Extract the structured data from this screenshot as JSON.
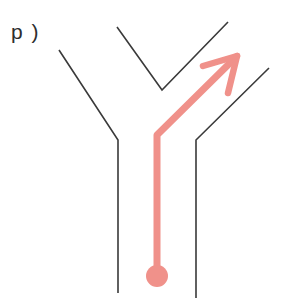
{
  "figure": {
    "panel_label": "p )",
    "width": 282,
    "height": 308,
    "background_color": "#ffffff",
    "line_color": "#3a3a3a",
    "accent_color": "#f0918a",
    "line_width": 1.6,
    "accent_width": 7
  },
  "chart_data": {
    "type": "diagram",
    "title": "",
    "annotations": [
      "p )"
    ],
    "legend": [],
    "elements": [
      {
        "name": "left-branch",
        "color": "#3a3a3a",
        "points": [
          [
            59,
            50
          ],
          [
            118,
            140
          ],
          [
            118,
            293
          ]
        ]
      },
      {
        "name": "center-v-wedge",
        "color": "#3a3a3a",
        "points": [
          [
            117,
            27
          ],
          [
            162,
            90
          ],
          [
            228,
            22
          ]
        ]
      },
      {
        "name": "right-branch",
        "color": "#3a3a3a",
        "points": [
          [
            269,
            68
          ],
          [
            196,
            140
          ],
          [
            196,
            298
          ]
        ]
      },
      {
        "name": "route-arrow",
        "color": "#f0918a",
        "points": [
          [
            157,
            268
          ],
          [
            157,
            135
          ],
          [
            233,
            60
          ]
        ]
      },
      {
        "name": "arrowhead",
        "color": "#f0918a",
        "tip": [
          237,
          56
        ],
        "barb_left": [
          203,
          66
        ],
        "barb_right": [
          228,
          93
        ]
      },
      {
        "name": "start-marker-dot",
        "color": "#f0918a",
        "center": [
          157,
          276
        ],
        "radius": 11
      }
    ],
    "xlabel": "",
    "ylabel": "",
    "grid": false
  }
}
